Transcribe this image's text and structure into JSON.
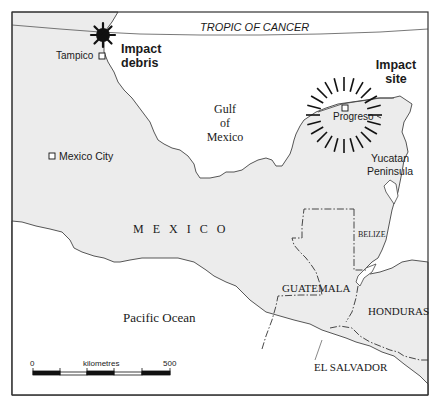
{
  "map": {
    "tropic_label": "TROPIC OF CANCER",
    "cities": {
      "tampico": "Tampico",
      "mexico_city": "Mexico City",
      "progreso": "Progreso"
    },
    "annotations": {
      "impact_debris_line1": "Impact",
      "impact_debris_line2": "debris",
      "impact_site_line1": "Impact",
      "impact_site_line2": "site"
    },
    "water": {
      "gulf_line1": "Gulf",
      "gulf_line2": "of",
      "gulf_line3": "Mexico",
      "pacific": "Pacific Ocean"
    },
    "regions": {
      "yucatan_line1": "Yucatan",
      "yucatan_line2": "Peninsula",
      "mexico": "M E X I C O",
      "belize": "BELIZE",
      "guatemala": "GUATEMALA",
      "honduras": "HONDURAS",
      "el_salvador": "EL SALVADOR"
    },
    "scale_bar": {
      "start": "0",
      "unit": "kilometres",
      "end": "500"
    },
    "colors": {
      "land": "#ececec",
      "water": "#ffffff",
      "border": "#333333",
      "ink": "#111111"
    }
  }
}
